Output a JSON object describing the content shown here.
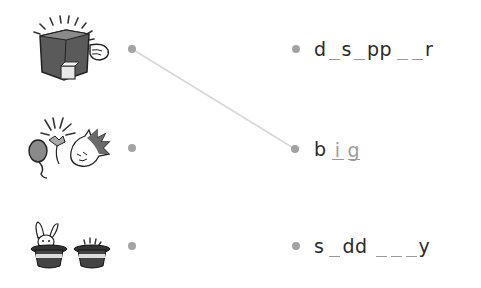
{
  "exercise": {
    "left_items": [
      {
        "id": "disappear-picture",
        "icon": "magic-box-disappear-icon"
      },
      {
        "id": "big-picture",
        "icon": "balloon-pop-icon"
      },
      {
        "id": "suddenly-picture",
        "icon": "rabbit-hats-icon"
      }
    ],
    "right_items": [
      {
        "segments": [
          {
            "t": "d"
          },
          {
            "blank": ""
          },
          {
            "t": "s"
          },
          {
            "blank": ""
          },
          {
            "t": "pp"
          },
          {
            "blank": ""
          },
          {
            "blank": ""
          },
          {
            "t": "r"
          }
        ]
      },
      {
        "segments": [
          {
            "t": "b"
          },
          {
            "blank": "i"
          },
          {
            "blank": "g"
          }
        ]
      },
      {
        "segments": [
          {
            "t": "s"
          },
          {
            "blank": ""
          },
          {
            "t": "dd"
          },
          {
            "blank": ""
          },
          {
            "blank": ""
          },
          {
            "blank": ""
          },
          {
            "t": "y"
          }
        ]
      }
    ],
    "connections": [
      {
        "from": 0,
        "to": 1
      }
    ],
    "colors": {
      "dot": "#a3a3a3",
      "line": "#d8d8d8",
      "text": "#2a2a2a",
      "filled_letter": "#9c9c9c"
    }
  },
  "words": {
    "w1": {
      "l1": "d",
      "l2": "s",
      "l3": "pp",
      "l4": "r"
    },
    "w2": {
      "l1": "b",
      "f1": "i",
      "f2": "g"
    },
    "w3": {
      "l1": "s",
      "l2": "dd",
      "l3": "y"
    }
  }
}
